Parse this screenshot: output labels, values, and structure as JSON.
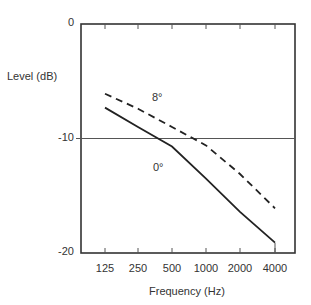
{
  "chart_data": {
    "type": "line",
    "title": "",
    "xlabel": "Frequency (Hz)",
    "ylabel": "Level (dB)",
    "x_scale": "log2",
    "categories": [
      "125",
      "250",
      "500",
      "1000",
      "2000",
      "4000"
    ],
    "x": [
      125,
      250,
      500,
      1000,
      2000,
      4000
    ],
    "yticks": [
      "0",
      "-10",
      "-20"
    ],
    "ylim": [
      -20,
      0
    ],
    "reference_line": {
      "y": -10
    },
    "grid": false,
    "legend": "inline labels",
    "series": [
      {
        "name": "0°",
        "style": "solid",
        "label": "0°",
        "values": [
          -7.3,
          -9.0,
          -10.7,
          -13.5,
          -16.4,
          -19.1
        ]
      },
      {
        "name": "8°",
        "style": "dashed",
        "label": "8°",
        "values": [
          -6.1,
          -7.4,
          -9.0,
          -10.6,
          -13.1,
          -16.1
        ]
      }
    ]
  },
  "labels": {
    "ylabel": "Level (dB)",
    "xlabel": "Frequency (Hz)",
    "y0": "0",
    "y10": "-10",
    "y20": "-20",
    "x125": "125",
    "x250": "250",
    "x500": "500",
    "x1000": "1000",
    "x2000": "2000",
    "x4000": "4000",
    "series_solid": "0°",
    "series_dashed": "8°"
  }
}
